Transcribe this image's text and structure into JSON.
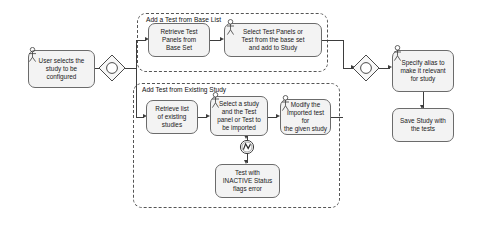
{
  "diagram": {
    "nodes": {
      "start_activity": "User selects the\nstudy to be\nconfigured",
      "retrieve_base_panels": "Retrieve Test\nPanels from\nBase Set",
      "select_base_panels": "Select  Test Panels or\nTest from the base set\nand add to Study",
      "retrieve_existing_studies": "Retrieve list\nof existing\nstudies",
      "select_study_and_test": "Select a study\nand the Test\npanel or Test to\nbe imported",
      "modify_imported_test": "Modify the\nimported test for\nthe given study",
      "inactive_status_error": "Test with\nINACTIVE Status\nflags error",
      "specify_alias": "Specify alias to\nmake it relevant\nfor study",
      "save_study": "Save Study with\nthe tests"
    },
    "groups": {
      "base_list": "Add a Test from Base List",
      "existing_study": "Add Test from Existing Study"
    },
    "decisions": {
      "fork": "decision-node-fork",
      "join": "decision-node-join"
    },
    "icons": {
      "actor": "actor-icon",
      "error": "error-event-icon"
    },
    "colors": {
      "node_fill": "#f3f3f3",
      "node_stroke": "#6b6b6b",
      "group_stroke": "#555555",
      "line": "#3d3d3d",
      "text": "#1a1a1a",
      "background": "#ffffff"
    }
  }
}
